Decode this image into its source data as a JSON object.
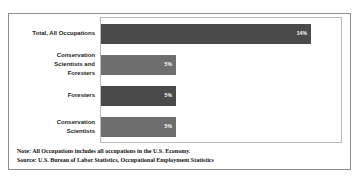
{
  "chart_data": {
    "type": "bar",
    "orientation": "horizontal",
    "title": "",
    "xlabel": "",
    "ylabel": "",
    "grid": false,
    "legend": false,
    "xlim": [
      0,
      16
    ],
    "categories": [
      "Total, All Occupations",
      "Conservation\nScientists and\nForesters",
      "Foresters",
      "Conservation\nScientists"
    ],
    "values": [
      14,
      5,
      5,
      5
    ],
    "value_labels": [
      "14%",
      "5%",
      "5%",
      "5%"
    ],
    "bar_colors": [
      "#4a4a4a",
      "#6e6e6e",
      "#4a4a4a",
      "#6e6e6e"
    ]
  },
  "notes": {
    "note": "Note: All Occupations includes all occupations in the U.S. Economy.",
    "source": "Source: U.S. Bureau of Labor Statistics, Occupational Employment Statistics"
  }
}
